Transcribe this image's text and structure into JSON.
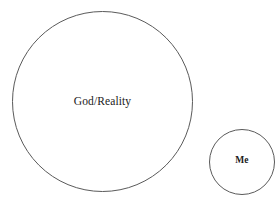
{
  "diagram": {
    "type": "two-circle-scale-comparison",
    "background_color": "#ffffff",
    "stroke_color": "#5a5a5a",
    "text_color": "#1a1a1a",
    "shapes": [
      {
        "id": "god-reality",
        "shape": "circle",
        "label": "God/Reality",
        "center_x": 102,
        "center_y": 101,
        "diameter": 181,
        "label_style": "regular"
      },
      {
        "id": "me",
        "shape": "circle",
        "label": "Me",
        "center_x": 242,
        "center_y": 162,
        "diameter": 66,
        "label_style": "bold"
      }
    ]
  }
}
